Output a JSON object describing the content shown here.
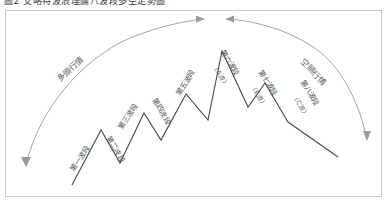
{
  "caption": {
    "text": "圖2  艾略特波浪理論八波段多空走勢圖"
  },
  "diagram": {
    "frame_border_color": "#c9c9c9",
    "wave_line_color": "#4c4c50",
    "arc_color": "#9a9a9e",
    "label_color": "#55555a",
    "background_color": "#ffffff",
    "phases": [
      {
        "name": "bull-phase",
        "label": "多頭行情",
        "x": 60,
        "y": 82,
        "rotate": -42
      },
      {
        "name": "bear-phase",
        "label": "空頭行情",
        "x": 300,
        "y": 62,
        "rotate": 46
      }
    ],
    "segments": [
      {
        "name": "wave-1",
        "label": "第一波段",
        "sub_label": "",
        "x": 74,
        "y": 172,
        "rotate": -57
      },
      {
        "name": "wave-2",
        "label": "第二波段",
        "sub_label": "",
        "x": 106,
        "y": 138,
        "rotate": 60
      },
      {
        "name": "wave-3",
        "label": "第三波段",
        "sub_label": "",
        "x": 122,
        "y": 130,
        "rotate": -57
      },
      {
        "name": "wave-4",
        "label": "第四波段",
        "sub_label": "",
        "x": 152,
        "y": 100,
        "rotate": 60
      },
      {
        "name": "wave-5",
        "label": "第五波段",
        "sub_label": "",
        "x": 180,
        "y": 96,
        "rotate": -58
      },
      {
        "name": "wave-6",
        "label": "第六波段",
        "sub_label": "（A波）",
        "x": 220,
        "y": 52,
        "rotate": 58
      },
      {
        "name": "wave-7",
        "label": "第七波段",
        "sub_label": "（B波）",
        "x": 258,
        "y": 72,
        "rotate": 58
      },
      {
        "name": "wave-8",
        "label": "第八波段",
        "sub_label": "（C波）",
        "x": 300,
        "y": 82,
        "rotate": 58
      }
    ],
    "wave_points": "72,185 101,130 120,163 144,113 161,140 186,94 208,120 222,51 248,107 265,83 288,122 338,157",
    "bull_arc": {
      "path": "M 27,161 C 40,110 80,60 130,38 C 160,26 185,21 204,19",
      "head": "205,19 196,15.5 196,22.5"
    },
    "bear_arc": {
      "path": "M 226,19 C 252,20 292,30 320,52 C 345,72 360,108 366,135",
      "head": "225,19 234,15.5 234,22.5",
      "end_head": "367,141 363,131 371,131"
    }
  }
}
